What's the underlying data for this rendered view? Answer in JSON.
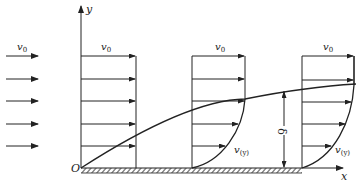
{
  "diagram": {
    "type": "boundary-layer-over-flat-plate",
    "colors": {
      "stroke": "#222222",
      "background": "#ffffff"
    },
    "axes": {
      "x_label": "x",
      "y_label": "y",
      "origin_label": "O"
    },
    "freestream": {
      "label_base": "v",
      "label_sub": "0",
      "arrow_count": 5
    },
    "profiles": [
      {
        "name": "uniform-profile-1",
        "top_label_base": "v",
        "top_label_sub": "0",
        "arrow_count": 5
      },
      {
        "name": "boundary-profile-2",
        "top_label_base": "v",
        "top_label_sub": "0",
        "profile_label_base": "v",
        "profile_label_sub": "(y)",
        "arrow_count": 5
      },
      {
        "name": "boundary-profile-3",
        "top_label_base": "v",
        "top_label_sub": "0",
        "profile_label_base": "v",
        "profile_label_sub": "(y)",
        "arrow_count": 6
      }
    ],
    "thickness_label": "δ",
    "wall": "hatched-flat-plate"
  }
}
